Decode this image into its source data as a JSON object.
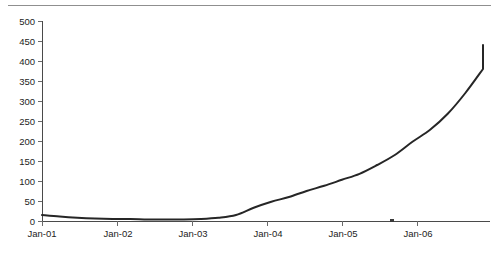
{
  "figure": {
    "name": "line-chart-figure",
    "has_top_rule": true,
    "background_color": "#ffffff",
    "line_color": "#262626",
    "axis_color": "#4a4a4a",
    "text_color": "#1d1d1d"
  },
  "chart_data": {
    "type": "line",
    "title": "",
    "subtitle": "",
    "xlabel": "",
    "ylabel": "",
    "legend": [],
    "legend_position": "none",
    "grid": false,
    "xlim_labels": [
      "Jan-01",
      "Jan-07"
    ],
    "ylim": [
      0,
      500
    ],
    "y_tick_step": 50,
    "y_ticks": [
      0,
      50,
      100,
      150,
      200,
      250,
      300,
      350,
      400,
      450,
      500
    ],
    "y_tick_labels": [
      "0",
      "50",
      "100",
      "150",
      "200",
      "250",
      "300",
      "350",
      "400",
      "450",
      "500"
    ],
    "x_ticks": [
      "Jan-01",
      "Jan-02",
      "Jan-03",
      "Jan-04",
      "Jan-05",
      "Jan-06"
    ],
    "x_tick_labels": [
      "Jan-01",
      "Jan-02",
      "Jan-03",
      "Jan-04",
      "Jan-05",
      "Jan-06"
    ],
    "categories": [
      "Jan-01",
      "Apr-01",
      "Jul-01",
      "Oct-01",
      "Jan-02",
      "Apr-02",
      "Jul-02",
      "Oct-02",
      "Jan-03",
      "Apr-03",
      "Jul-03",
      "Oct-03",
      "Jan-04",
      "Apr-04",
      "Jul-04",
      "Oct-04",
      "Jan-05",
      "Apr-05",
      "Jul-05",
      "Oct-05",
      "Jan-06",
      "Apr-06",
      "Jul-06",
      "Oct-06",
      "Jan-07",
      "Apr-07"
    ],
    "values": [
      15,
      11,
      8,
      6,
      5,
      5,
      4,
      4,
      4,
      5,
      8,
      15,
      33,
      48,
      60,
      75,
      88,
      103,
      118,
      140,
      165,
      198,
      228,
      268,
      320,
      380
    ],
    "series": [
      {
        "name": "series-1",
        "values": [
          15,
          11,
          8,
          6,
          5,
          5,
          4,
          4,
          4,
          5,
          8,
          15,
          33,
          48,
          60,
          75,
          88,
          103,
          118,
          140,
          165,
          198,
          228,
          268,
          320,
          380
        ]
      }
    ],
    "end_value": 440,
    "start_value": 15,
    "min_value": 4,
    "max_value": 440,
    "annotations": []
  }
}
